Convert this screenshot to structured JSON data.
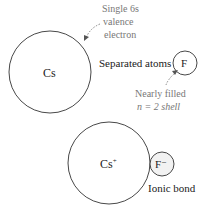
{
  "diagram": {
    "top": {
      "cs_label": "Cs",
      "f_label": "F",
      "caption": "Separated atoms",
      "valence_note": [
        "Single 6s",
        "valence",
        "electron"
      ],
      "shell_note": [
        "Nearly filled",
        "n = 2 shell"
      ]
    },
    "bottom": {
      "cs_label": "Cs",
      "cs_charge": "+",
      "f_label": "F",
      "f_charge": "−",
      "caption": "Ionic bond"
    },
    "colors": {
      "outline": "#333333",
      "annotation": "#777777",
      "text": "#222222"
    }
  }
}
